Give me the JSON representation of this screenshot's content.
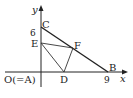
{
  "diagram": {
    "type": "coordinate-geometry",
    "axes": {
      "x_label": "x",
      "y_label": "y",
      "origin_label": "O(=A)",
      "x_tick": "9",
      "y_tick": "6"
    },
    "points": {
      "C": {
        "label": "C",
        "coords": [
          0,
          6
        ]
      },
      "B": {
        "label": "B",
        "coords": [
          9,
          0
        ]
      },
      "E": {
        "label": "E"
      },
      "F": {
        "label": "F"
      },
      "D": {
        "label": "D"
      }
    },
    "segments": [
      "CB",
      "EF",
      "ED",
      "DF",
      "OC",
      "OB"
    ],
    "colors": {
      "stroke": "#222222",
      "background": "#ffffff"
    }
  }
}
